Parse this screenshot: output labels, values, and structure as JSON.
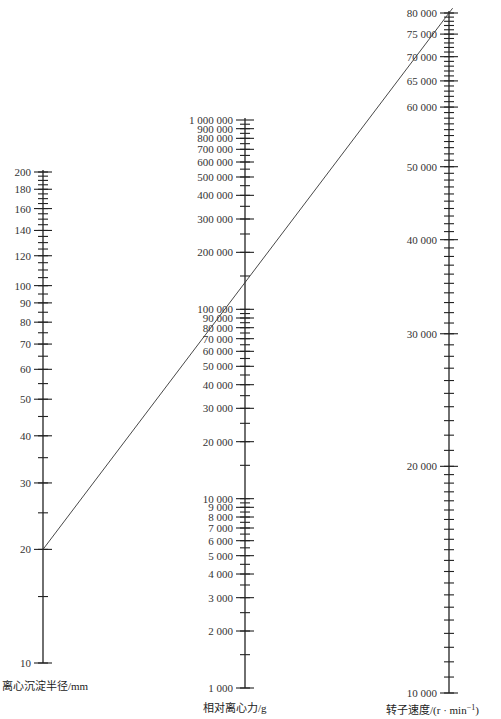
{
  "chart_data": {
    "type": "nomogram",
    "title": "",
    "axes": [
      {
        "id": "radius",
        "label": "离心沉淀半径/mm",
        "scale": "log",
        "range": [
          10,
          200
        ],
        "labeled_ticks": [
          10,
          20,
          30,
          40,
          50,
          60,
          70,
          80,
          90,
          100,
          120,
          140,
          160,
          180,
          200
        ],
        "tick_labels": [
          "10",
          "20",
          "30",
          "40",
          "50",
          "60",
          "70",
          "80",
          "90",
          "100",
          "120",
          "140",
          "160",
          "180",
          "200"
        ]
      },
      {
        "id": "rcf",
        "label": "相对离心力/g",
        "scale": "log",
        "range": [
          1000,
          1000000
        ],
        "labeled_ticks": [
          1000,
          2000,
          3000,
          4000,
          5000,
          6000,
          7000,
          8000,
          9000,
          10000,
          20000,
          30000,
          40000,
          50000,
          60000,
          70000,
          80000,
          90000,
          100000,
          200000,
          300000,
          400000,
          500000,
          600000,
          700000,
          800000,
          900000,
          1000000
        ],
        "tick_labels": [
          "1 000",
          "2 000",
          "3 000",
          "4 000",
          "5 000",
          "6 000",
          "7 000",
          "8 000",
          "9 000",
          "10 000",
          "20 000",
          "30 000",
          "40 000",
          "50 000",
          "60 000",
          "70 000",
          "80 000",
          "90 000",
          "100 000",
          "200 000",
          "300 000",
          "400 000",
          "500 000",
          "600 000",
          "700 000",
          "800 000",
          "900 000",
          "1 000 000"
        ]
      },
      {
        "id": "speed",
        "label": "转子速度/(r·min⁻¹)",
        "scale": "log",
        "range": [
          10000,
          80000
        ],
        "labeled_ticks": [
          10000,
          20000,
          30000,
          40000,
          50000,
          60000,
          65000,
          70000,
          75000,
          80000
        ],
        "tick_labels": [
          "10 000",
          "20 000",
          "30 000",
          "40 000",
          "50 000",
          "60 000",
          "65 000",
          "70 000",
          "75 000",
          "80 000"
        ]
      }
    ],
    "example_line": {
      "radius_mm": 20,
      "rcf_g": 150000,
      "speed_rpm": 80000
    },
    "grid": false,
    "legend": null
  },
  "labels": {
    "radius_axis": "离心沉淀半径/mm",
    "rcf_axis": "相对离心力/g",
    "speed_axis_main": "转子速度/(r · min",
    "speed_axis_sup": "−1",
    "speed_axis_close": ")"
  }
}
